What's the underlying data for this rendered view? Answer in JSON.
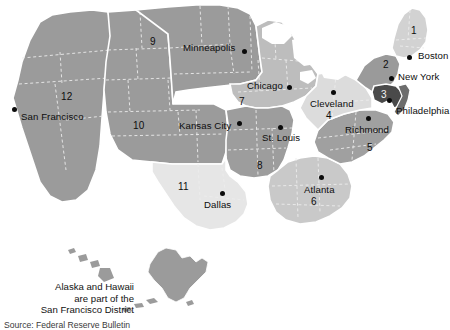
{
  "figure": {
    "kind": "map",
    "background_color": "#ffffff"
  },
  "palette": {
    "tone_lightest": "#e2e2e2",
    "tone_light": "#d0d0d0",
    "tone_mid_light": "#bdbdbd",
    "tone_mid": "#a8a8a8",
    "tone_mid_dark": "#949494",
    "tone_dark": "#7b7b7b",
    "tone_darkest": "#4a4a4a",
    "border": "#ffffff",
    "state_line": "#f2f2f2",
    "text": "#0d0d0d",
    "dot": "#0b0b0b"
  },
  "districts": [
    {
      "number": "1",
      "city": "Boston",
      "tone": "#d2d2d2"
    },
    {
      "number": "2",
      "city": "New York",
      "tone": "#9a9a9a"
    },
    {
      "number": "3",
      "city": "Philadelphia",
      "tone": "#4a4a4a"
    },
    {
      "number": "4",
      "city": "Cleveland",
      "tone": "#dcdcdc"
    },
    {
      "number": "5",
      "city": "Richmond",
      "tone": "#a0a0a0"
    },
    {
      "number": "6",
      "city": "Atlanta",
      "tone": "#c9c9c9"
    },
    {
      "number": "7",
      "city": "Chicago",
      "tone": "#bdbdbd"
    },
    {
      "number": "8",
      "city": "St. Louis",
      "tone": "#9d9d9d"
    },
    {
      "number": "9",
      "city": "Minneapolis",
      "tone": "#9b9b9b"
    },
    {
      "number": "10",
      "city": "Kansas City",
      "tone": "#9b9b9b"
    },
    {
      "number": "11",
      "city": "Dallas",
      "tone": "#e6e6e6"
    },
    {
      "number": "12",
      "city": "San Francisco",
      "tone": "#9b9b9b"
    }
  ],
  "district_numbers": [
    {
      "id": "num-1",
      "text": "1",
      "x": 411,
      "y": 30
    },
    {
      "id": "num-2",
      "text": "2",
      "x": 383,
      "y": 64
    },
    {
      "id": "num-3",
      "text": "3",
      "x": 393,
      "y": 94
    },
    {
      "id": "num-4",
      "text": "4",
      "x": 327,
      "y": 116
    },
    {
      "id": "num-5",
      "text": "5",
      "x": 368,
      "y": 147
    },
    {
      "id": "num-6",
      "text": "6",
      "x": 312,
      "y": 202
    },
    {
      "id": "num-7",
      "text": "7",
      "x": 240,
      "y": 101
    },
    {
      "id": "num-8",
      "text": "8",
      "x": 258,
      "y": 166
    },
    {
      "id": "num-9",
      "text": "9",
      "x": 151,
      "y": 41
    },
    {
      "id": "num-10",
      "text": "10",
      "x": 136,
      "y": 125
    },
    {
      "id": "num-11",
      "text": "11",
      "x": 180,
      "y": 186
    },
    {
      "id": "num-12",
      "text": "12",
      "x": 63,
      "y": 97
    }
  ],
  "cities": [
    {
      "id": "city-boston",
      "label": "Boston",
      "label_x": 418,
      "label_y": 56,
      "anchor": "start",
      "dot_x": 410,
      "dot_y": 58
    },
    {
      "id": "city-new-york",
      "label": "New York",
      "label_x": 398,
      "label_y": 77,
      "anchor": "start",
      "dot_x": 392,
      "dot_y": 79
    },
    {
      "id": "city-philadelphia",
      "label": "Philadelphia",
      "label_x": 396,
      "label_y": 111,
      "anchor": "start",
      "dot_x": 390,
      "dot_y": 101
    },
    {
      "id": "city-cleveland",
      "label": "Cleveland",
      "label_x": 313,
      "label_y": 104,
      "anchor": "start",
      "dot_x": 334,
      "dot_y": 93
    },
    {
      "id": "city-richmond",
      "label": "Richmond",
      "label_x": 347,
      "label_y": 130,
      "anchor": "start",
      "dot_x": 369,
      "dot_y": 119
    },
    {
      "id": "city-atlanta",
      "label": "Atlanta",
      "label_x": 306,
      "label_y": 190,
      "anchor": "start",
      "dot_x": 322,
      "dot_y": 178
    },
    {
      "id": "city-chicago",
      "label": "Chicago",
      "label_x": 249,
      "label_y": 86,
      "anchor": "start",
      "dot_x": 290,
      "dot_y": 88
    },
    {
      "id": "city-st-louis",
      "label": "St. Louis",
      "label_x": 264,
      "label_y": 138,
      "anchor": "start",
      "dot_x": 281,
      "dot_y": 128
    },
    {
      "id": "city-minneapolis",
      "label": "Minneapolis",
      "label_x": 185,
      "label_y": 47,
      "anchor": "start",
      "dot_x": 245,
      "dot_y": 52
    },
    {
      "id": "city-kansas-city",
      "label": "Kansas City",
      "label_x": 181,
      "label_y": 126,
      "anchor": "start",
      "dot_x": 240,
      "dot_y": 124
    },
    {
      "id": "city-dallas",
      "label": "Dallas",
      "label_x": 206,
      "label_y": 205,
      "anchor": "start",
      "dot_x": 223,
      "dot_y": 194
    },
    {
      "id": "city-san-francisco",
      "label": "San Francisco",
      "label_x": 22,
      "label_y": 116,
      "anchor": "start",
      "dot_x": 15,
      "dot_y": 110
    }
  ],
  "annotation": {
    "line1": "Alaska and Hawaii",
    "line2": "are part of the",
    "line3": "San Francisco District"
  },
  "source_note": {
    "text": "Source: Federal Reserve Bulletin"
  }
}
